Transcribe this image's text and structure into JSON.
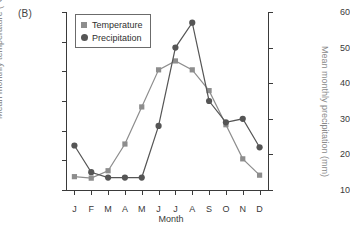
{
  "panel": {
    "label": "(B)"
  },
  "legend": {
    "items": [
      {
        "label": "Temperature",
        "marker": "square-marker-icon",
        "color": "#8d8d8d"
      },
      {
        "label": "Precipitation",
        "marker": "circle-marker-icon",
        "color": "#555555"
      }
    ]
  },
  "axes": {
    "x_title": "Month",
    "y_left_title": "Mean monthly temperature (°C)",
    "y_right_title": "Mean monthly precipitation (mm)",
    "x_ticklabels": [
      "J",
      "F",
      "M",
      "A",
      "M",
      "J",
      "J",
      "A",
      "S",
      "O",
      "N",
      "D"
    ],
    "y_left_ticklabels": [
      "30",
      "20",
      "10",
      "0",
      "-10",
      "-20",
      "-30"
    ],
    "y_right_ticklabels": [
      "60",
      "50",
      "40",
      "30",
      "20",
      "10"
    ]
  },
  "chart_data": {
    "type": "line",
    "title": "(B)",
    "xlabel": "Month",
    "ylabel": "Mean monthly temperature (°C)",
    "y2label": "Mean monthly precipitation (mm)",
    "categories": [
      "J",
      "F",
      "M",
      "A",
      "M",
      "J",
      "J",
      "A",
      "S",
      "O",
      "N",
      "D"
    ],
    "ylim": [
      -30,
      30
    ],
    "y2lim": [
      10,
      60
    ],
    "yticks": [
      -30,
      -20,
      -10,
      0,
      10,
      20,
      30
    ],
    "y2ticks": [
      10,
      20,
      30,
      40,
      50,
      60
    ],
    "grid": false,
    "legend_position": "upper-left-inside",
    "series": [
      {
        "name": "Temperature",
        "axis": "left",
        "units": "°C",
        "marker": "square",
        "color": "#8d8d8d",
        "values": [
          -25.5,
          -26,
          -23.5,
          -14.5,
          -2,
          10.5,
          13.5,
          10.5,
          3.5,
          -8,
          -19.5,
          -25
        ]
      },
      {
        "name": "Precipitation",
        "axis": "right",
        "units": "mm",
        "marker": "circle",
        "color": "#555555",
        "values": [
          22.5,
          15,
          13.5,
          13.5,
          13.5,
          28,
          50,
          57,
          35,
          29,
          30,
          22
        ]
      }
    ]
  }
}
